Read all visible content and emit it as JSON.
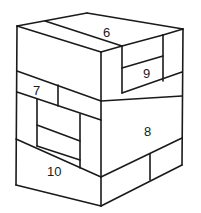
{
  "diagram": {
    "title": "",
    "line_color": "#1a1a1a",
    "background": "#ffffff",
    "labels": [
      {
        "id": "block-6",
        "text": "6",
        "x": 107,
        "y": 36
      },
      {
        "id": "block-9",
        "text": "9",
        "x": 142,
        "y": 78
      },
      {
        "id": "block-7",
        "text": "7",
        "x": 34,
        "y": 95
      },
      {
        "id": "block-8",
        "text": "8",
        "x": 144,
        "y": 136
      },
      {
        "id": "block-10",
        "text": "10",
        "x": 52,
        "y": 176
      }
    ]
  }
}
